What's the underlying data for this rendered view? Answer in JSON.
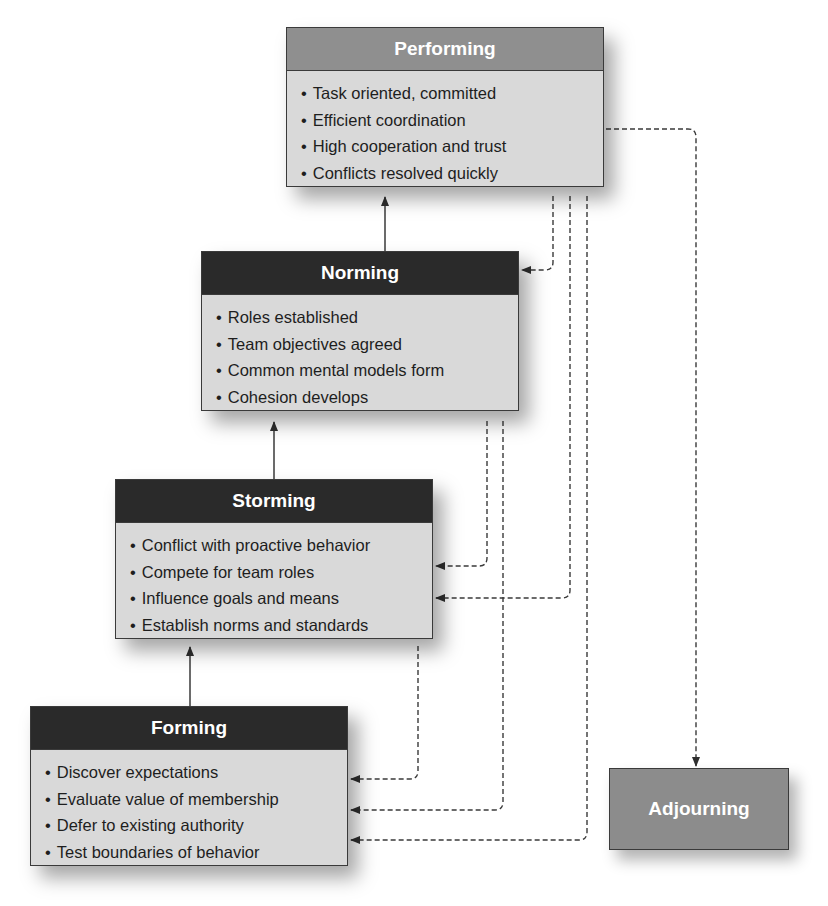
{
  "diagram": {
    "stages": [
      {
        "name": "Performing",
        "header_style": "gray",
        "items": [
          "Task oriented, committed",
          "Efficient coordination",
          "High cooperation and trust",
          "Conflicts resolved quickly"
        ]
      },
      {
        "name": "Norming",
        "header_style": "dark",
        "items": [
          "Roles established",
          "Team objectives agreed",
          "Common mental models form",
          "Cohesion develops"
        ]
      },
      {
        "name": "Storming",
        "header_style": "dark",
        "items": [
          "Conflict with proactive behavior",
          "Compete for team roles",
          "Influence goals and means",
          "Establish norms and standards"
        ]
      },
      {
        "name": "Forming",
        "header_style": "dark",
        "items": [
          "Discover expectations",
          "Evaluate value of membership",
          "Defer to existing authority",
          "Test boundaries of behavior"
        ]
      }
    ],
    "terminal_stage": {
      "name": "Adjourning"
    },
    "edges": {
      "solid_progression": [
        "Forming → Storming",
        "Storming → Norming",
        "Norming → Performing"
      ],
      "dashed_regression": [
        "Performing → Norming",
        "Performing → Storming",
        "Performing → Forming",
        "Norming → Storming",
        "Norming → Forming",
        "Storming → Forming",
        "Performing → Adjourning"
      ]
    },
    "colors": {
      "header_gray": "#8f8f8f",
      "header_dark": "#2a2a2a",
      "body_fill": "#d9d9d9",
      "adjourning_fill": "#8c8c8c",
      "line": "#3a3a3a"
    }
  }
}
